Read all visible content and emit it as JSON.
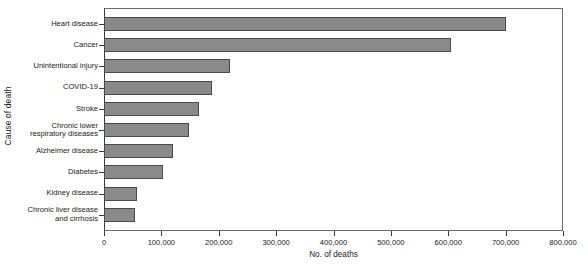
{
  "chart_data": {
    "type": "bar",
    "orientation": "horizontal",
    "title": "",
    "xlabel": "No. of deaths",
    "ylabel": "Cause of death",
    "categories": [
      "Heart disease",
      "Cancer",
      "Unintentional injury",
      "COVID-19",
      "Stroke",
      "Chronic lower\nrespiratory diseases",
      "Alzheimer disease",
      "Diabetes",
      "Kidney disease",
      "Chronic liver disease\nand cirrhosis"
    ],
    "values": [
      701000,
      605000,
      220000,
      188000,
      166000,
      148000,
      120000,
      103000,
      58000,
      54000
    ],
    "xlim": [
      0,
      800000
    ],
    "xticks": [
      0,
      100000,
      200000,
      300000,
      400000,
      500000,
      600000,
      700000,
      800000
    ],
    "xtick_labels": [
      "0",
      "100,000",
      "200,000",
      "300,000",
      "400,000",
      "500,000",
      "600,000",
      "700,000",
      "800,000"
    ],
    "grid": false,
    "legend": false,
    "bar_color": "#8a8a8a",
    "bar_edge_color": "#4a4a4a",
    "axis_color": "#3a3a3a",
    "background": "#ffffff"
  }
}
